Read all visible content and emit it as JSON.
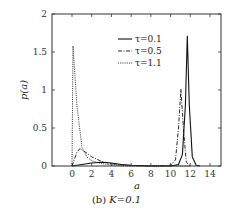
{
  "chart_data": {
    "type": "line",
    "title": "",
    "caption": "(b) K=0.1",
    "caption_prefix": "(b)",
    "caption_math": "K=0.1",
    "xlabel": "a",
    "ylabel": "p(a)",
    "xlim": [
      -2,
      15
    ],
    "ylim": [
      0,
      2
    ],
    "xticks": [
      0,
      2,
      4,
      6,
      8,
      10,
      12,
      14
    ],
    "yticks": [
      0,
      0.5,
      1,
      1.5,
      2
    ],
    "ytick_labels": [
      "0",
      "0.5",
      "1",
      "1.5",
      "2"
    ],
    "grid": false,
    "legend_position": "upper right",
    "series": [
      {
        "name": "τ=0.1",
        "style": "solid",
        "x": [
          0,
          0.5,
          1,
          2,
          3,
          4,
          5,
          6,
          8,
          10,
          10.8,
          11.2,
          11.5,
          11.7,
          11.9,
          12.2,
          12.6,
          13
        ],
        "y": [
          0,
          0.01,
          0.02,
          0.04,
          0.05,
          0.04,
          0.02,
          0.01,
          0.0,
          0.0,
          0.02,
          0.15,
          0.8,
          1.71,
          0.8,
          0.12,
          0.01,
          0
        ]
      },
      {
        "name": "τ=0.5",
        "style": "dashdot",
        "x": [
          0,
          0.5,
          0.8,
          1.5,
          2,
          3,
          4,
          5,
          6,
          8,
          10,
          10.5,
          10.8,
          11.05,
          11.3,
          11.6,
          12
        ],
        "y": [
          0,
          0.18,
          0.23,
          0.17,
          0.12,
          0.06,
          0.03,
          0.015,
          0.005,
          0,
          0.01,
          0.08,
          0.5,
          1.01,
          0.5,
          0.05,
          0
        ]
      },
      {
        "name": "τ=1.1",
        "style": "dotted",
        "x": [
          0,
          0.1,
          0.5,
          1,
          1.5,
          2,
          3,
          4,
          5,
          6,
          8,
          10,
          12
        ],
        "y": [
          0,
          1.58,
          0.8,
          0.25,
          0.12,
          0.07,
          0.03,
          0.015,
          0.005,
          0,
          0,
          0,
          0
        ]
      }
    ]
  }
}
